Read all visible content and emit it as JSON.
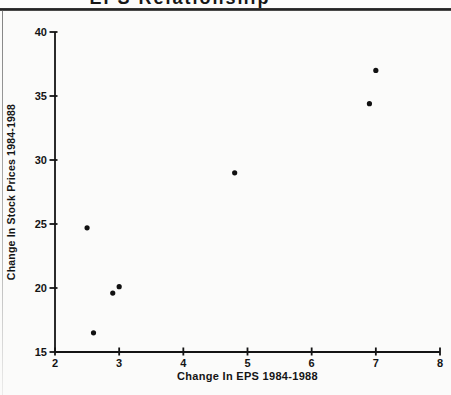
{
  "page": {
    "background": "#fbfbfa"
  },
  "header": {
    "title": "EPS Relationship",
    "title_note": "partially cut off at top edge of screenshot",
    "rule_color": "#2b2b2b"
  },
  "chart_data": {
    "type": "scatter",
    "title": "EPS Relationship",
    "xlabel": "Change In EPS 1984-1988",
    "ylabel": "Change In Stock Prices 1984-1988",
    "xlim": [
      2,
      8
    ],
    "ylim": [
      15,
      40
    ],
    "x_ticks": [
      2,
      3,
      4,
      5,
      6,
      7,
      8
    ],
    "y_ticks": [
      15,
      20,
      25,
      30,
      35,
      40
    ],
    "grid": false,
    "axis_color": "#141414",
    "marker": {
      "shape": "circle",
      "color": "#111111",
      "radius_px": 2.6
    },
    "points": [
      {
        "x": 2.5,
        "y": 24.7
      },
      {
        "x": 2.6,
        "y": 16.5
      },
      {
        "x": 2.9,
        "y": 19.6
      },
      {
        "x": 3.0,
        "y": 20.1
      },
      {
        "x": 4.8,
        "y": 29.0
      },
      {
        "x": 6.9,
        "y": 34.4
      },
      {
        "x": 7.0,
        "y": 37.0
      }
    ]
  }
}
